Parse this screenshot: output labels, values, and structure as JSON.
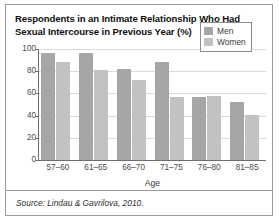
{
  "figure": {
    "title": "Respondents in an Intimate Relationship Who Had Sexual Intercourse in Previous Year (%)",
    "source": "Source: Lindau & Gavrilova, 2010."
  },
  "chart_data": {
    "type": "bar",
    "title": "Respondents in an Intimate Relationship Who Had Sexual Intercourse in Previous Year (%)",
    "xlabel": "Age",
    "ylabel": "",
    "ylim": [
      0,
      100
    ],
    "yticks": [
      0,
      20,
      40,
      60,
      80,
      100
    ],
    "grid": true,
    "legend_position": "top-right",
    "categories": [
      "57–60",
      "61–65",
      "66–70",
      "71–75",
      "76–80",
      "81–85"
    ],
    "series": [
      {
        "name": "Men",
        "color": "#a6a6a6",
        "values": [
          96,
          96,
          82,
          88,
          57,
          52
        ]
      },
      {
        "name": "Women",
        "color": "#c2c2c2",
        "values": [
          88,
          81,
          72,
          57,
          58,
          41
        ]
      }
    ]
  }
}
